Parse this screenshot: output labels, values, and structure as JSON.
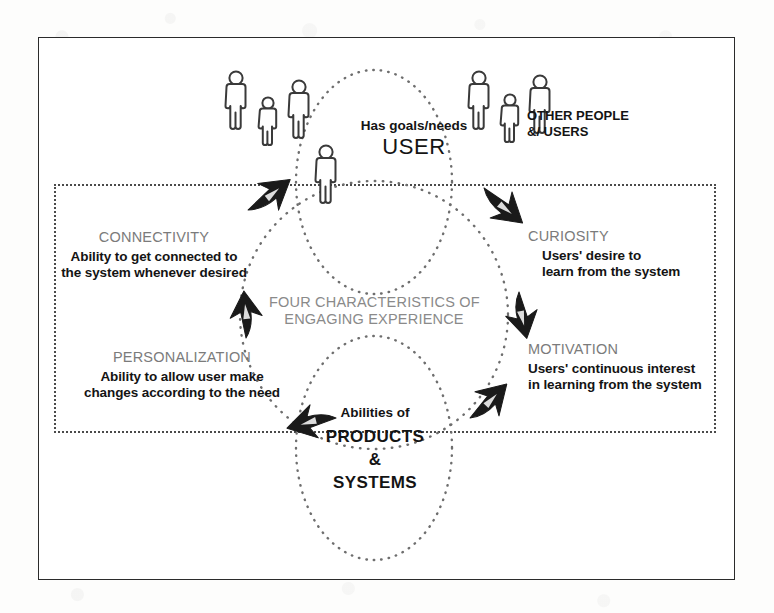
{
  "diagram": {
    "title_center": {
      "line1": "FOUR CHARACTERISTICS OF",
      "line2": "ENGAGING EXPERIENCE"
    },
    "nodes": {
      "user": {
        "sub": "Has goals/needs",
        "main": "USER"
      },
      "products": {
        "sub": "Abilities of",
        "line1": "PRODUCTS",
        "line2": "&",
        "line3": "SYSTEMS"
      }
    },
    "people_group_label": {
      "line1": "OTHER PEOPLE",
      "line2": "&/ USERS"
    },
    "characteristics": [
      {
        "id": "connectivity",
        "heading": "CONNECTIVITY",
        "desc_line1": "Ability to get connected to",
        "desc_line2": "the system whenever desired"
      },
      {
        "id": "curiosity",
        "heading": "CURIOSITY",
        "desc_line1": "Users' desire to",
        "desc_line2": "learn from the system"
      },
      {
        "id": "motivation",
        "heading": "MOTIVATION",
        "desc_line1": "Users' continuous interest",
        "desc_line2": "in learning from the system"
      },
      {
        "id": "personalization",
        "heading": "PERSONALIZATION",
        "desc_line1": "Ability to allow user make",
        "desc_line2": "changes according to the need"
      }
    ],
    "colors": {
      "frame": "#2b2b2b",
      "dotted": "#4a4a4a",
      "heading_gray": "#7b7b7b",
      "text_black": "#141414",
      "arrow_black": "#1a1a1a",
      "background": "#ffffff"
    },
    "icons": {
      "person": "person-figure-icon",
      "arrow": "curved-arrow-icon"
    }
  }
}
